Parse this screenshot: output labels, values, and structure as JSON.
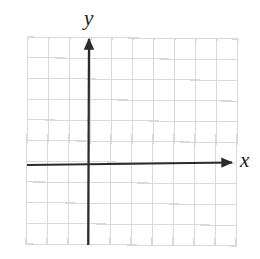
{
  "figure": {
    "kind": "blank-coordinate-plane",
    "background_color": "#ffffff",
    "width": 260,
    "height": 259
  },
  "grid": {
    "columns": 10,
    "rows": 10,
    "cell_width": 21,
    "cell_height": 20.7,
    "left": 27,
    "top": 38,
    "right": 237,
    "bottom": 245,
    "line_color": "#d9d9d9",
    "line_width": 1.1,
    "skew_note": "scan skew, grid rotated about 0.6 degrees"
  },
  "axes": {
    "color": "#2b2b2b",
    "line_width": 2.2,
    "x_axis": {
      "label": "x",
      "label_left": 240,
      "label_top": 150,
      "y_position": 163,
      "start_x": 27,
      "end_x": 232,
      "arrow": "right",
      "arrow_tip_x": 233,
      "arrow_tip_y": 163
    },
    "y_axis": {
      "label": "y",
      "label_left": 84,
      "label_top": 8,
      "x_position": 89,
      "start_y": 245,
      "end_y": 39,
      "arrow": "up",
      "arrow_tip_x": 89,
      "arrow_tip_y": 38
    },
    "origin": {
      "x": 89,
      "y": 163
    }
  },
  "chart_data": {
    "type": "scatter",
    "title": "",
    "subtitle": "",
    "xlabel": "x",
    "ylabel": "y",
    "xlim": [
      -3,
      7
    ],
    "ylim": [
      -4,
      6
    ],
    "x": [],
    "y": [],
    "series": [],
    "annotations": [],
    "legend": {
      "entries": [],
      "position": "none"
    },
    "grid": true,
    "grid_columns": 10,
    "grid_rows": 10
  }
}
